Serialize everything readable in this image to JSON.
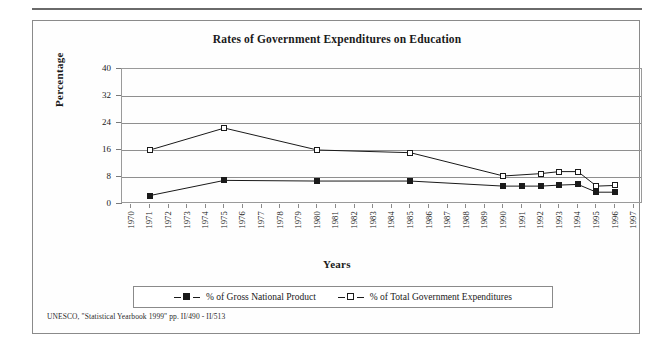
{
  "figure": {
    "title": "Rates of Government Expenditures on Education",
    "source_note": "UNESCO, \"Statistical Yearbook 1999\" pp. II/490 - II/513"
  },
  "chart_data": {
    "type": "line",
    "title": "Rates of Government Expenditures on Education",
    "xlabel": "Years",
    "ylabel": "Percentage",
    "ylim": [
      0,
      40
    ],
    "yticks": [
      0,
      8,
      16,
      24,
      32,
      40
    ],
    "grid": true,
    "legend_position": "bottom",
    "categories": [
      "1970",
      "1971",
      "1972",
      "1973",
      "1974",
      "1975",
      "1976",
      "1977",
      "1978",
      "1979",
      "1980",
      "1981",
      "1982",
      "1983",
      "1984",
      "1985",
      "1986",
      "1987",
      "1988",
      "1989",
      "1990",
      "1991",
      "1992",
      "1993",
      "1994",
      "1995",
      "1996",
      "1997"
    ],
    "series": [
      {
        "name": "% of Gross National Product",
        "marker": "filled-square",
        "color": "#1a1a1a",
        "points": [
          {
            "x": "1971",
            "y": 2.5
          },
          {
            "x": "1975",
            "y": 7.0
          },
          {
            "x": "1980",
            "y": 6.8
          },
          {
            "x": "1985",
            "y": 6.8
          },
          {
            "x": "1990",
            "y": 5.3
          },
          {
            "x": "1991",
            "y": 5.3
          },
          {
            "x": "1992",
            "y": 5.3
          },
          {
            "x": "1993",
            "y": 5.6
          },
          {
            "x": "1994",
            "y": 5.8
          },
          {
            "x": "1995",
            "y": 3.5
          },
          {
            "x": "1996",
            "y": 3.5
          }
        ]
      },
      {
        "name": "% of Total Government Expenditures",
        "marker": "open-square",
        "color": "#1a1a1a",
        "points": [
          {
            "x": "1971",
            "y": 16.0
          },
          {
            "x": "1975",
            "y": 22.5
          },
          {
            "x": "1980",
            "y": 16.0
          },
          {
            "x": "1985",
            "y": 15.2
          },
          {
            "x": "1990",
            "y": 8.3
          },
          {
            "x": "1992",
            "y": 9.0
          },
          {
            "x": "1993",
            "y": 9.6
          },
          {
            "x": "1994",
            "y": 9.6
          },
          {
            "x": "1995",
            "y": 5.3
          },
          {
            "x": "1996",
            "y": 5.5
          }
        ]
      }
    ],
    "legend": [
      {
        "label": "% of Gross National Product",
        "marker": "filled-square"
      },
      {
        "label": "% of Total Government Expenditures",
        "marker": "open-square"
      }
    ]
  }
}
